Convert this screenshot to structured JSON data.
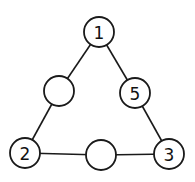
{
  "diagram": {
    "type": "triangle-number-puzzle",
    "nodes": [
      {
        "id": "top",
        "label": "1",
        "cx": 99,
        "cy": 32
      },
      {
        "id": "left-mid",
        "label": "",
        "cx": 59,
        "cy": 91
      },
      {
        "id": "right-mid",
        "label": "5",
        "cx": 135,
        "cy": 93
      },
      {
        "id": "bottom-left",
        "label": "2",
        "cx": 25,
        "cy": 153
      },
      {
        "id": "bottom-mid",
        "label": "",
        "cx": 101,
        "cy": 155
      },
      {
        "id": "bottom-right",
        "label": "3",
        "cx": 169,
        "cy": 154
      }
    ],
    "edges": [
      [
        "top",
        "left-mid"
      ],
      [
        "left-mid",
        "bottom-left"
      ],
      [
        "top",
        "right-mid"
      ],
      [
        "right-mid",
        "bottom-right"
      ],
      [
        "bottom-left",
        "bottom-mid"
      ],
      [
        "bottom-mid",
        "bottom-right"
      ]
    ],
    "colors": {
      "stroke": "#1a1a1a",
      "fill": "#ffffff",
      "text": "#111111"
    }
  }
}
